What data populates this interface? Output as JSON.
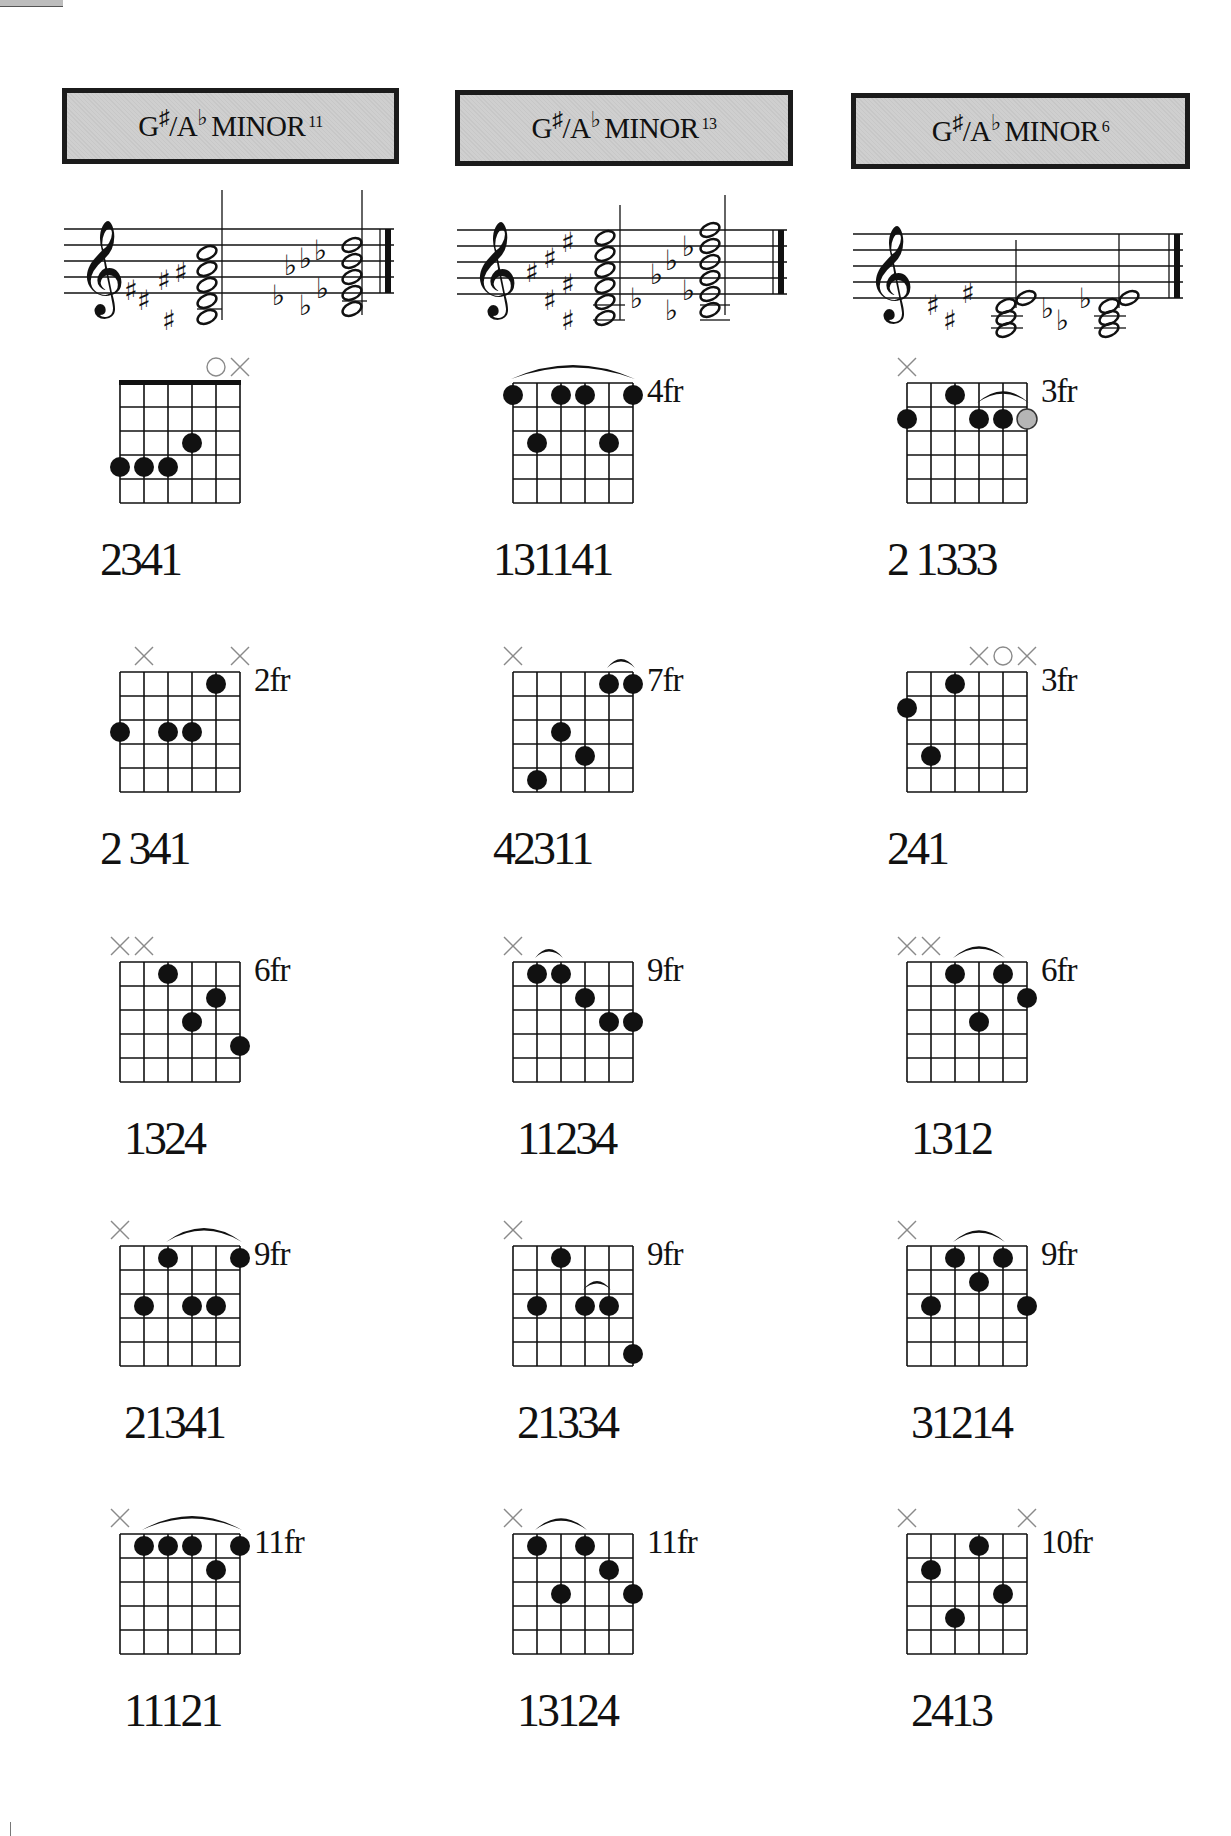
{
  "page": {
    "columns": [
      {
        "root": "G",
        "root_acc": "♯",
        "slash": "/A",
        "slash_acc": "♭",
        "quality": "MINOR",
        "ext": "11"
      },
      {
        "root": "G",
        "root_acc": "♯",
        "slash": "/A",
        "slash_acc": "♭",
        "quality": "MINOR",
        "ext": "13"
      },
      {
        "root": "G",
        "root_acc": "♯",
        "slash": "/A",
        "slash_acc": "♭",
        "quality": "MINOR",
        "ext": "6"
      }
    ]
  },
  "diagrams": [
    [
      {
        "nut": true,
        "fret": "",
        "markers": [
          {
            "s": 4,
            "t": "O"
          },
          {
            "s": 5,
            "t": "X"
          }
        ],
        "arcs": [],
        "dots": [
          [
            0,
            4
          ],
          [
            1,
            4
          ],
          [
            2,
            4
          ],
          [
            3,
            3
          ]
        ],
        "grey": [],
        "fingering": "2341"
      },
      {
        "nut": false,
        "fret": "4fr",
        "markers": [],
        "arcs": [
          [
            0,
            5
          ]
        ],
        "dots": [
          [
            0,
            1
          ],
          [
            2,
            1
          ],
          [
            3,
            1
          ],
          [
            5,
            1
          ],
          [
            1,
            3
          ],
          [
            4,
            3
          ]
        ],
        "grey": [],
        "fingering": "131141"
      },
      {
        "nut": false,
        "fret": "3fr",
        "markers": [
          {
            "s": 0,
            "t": "X"
          }
        ],
        "arcs": [
          [
            3,
            5,
            2
          ]
        ],
        "dots": [
          [
            0,
            2
          ],
          [
            2,
            1
          ],
          [
            3,
            2
          ],
          [
            4,
            2
          ]
        ],
        "grey": [
          [
            5,
            2
          ]
        ],
        "fingering": "2 1333"
      }
    ],
    [
      {
        "nut": false,
        "fret": "2fr",
        "markers": [
          {
            "s": 1,
            "t": "X"
          },
          {
            "s": 5,
            "t": "X"
          }
        ],
        "arcs": [],
        "dots": [
          [
            4,
            1
          ],
          [
            0,
            3
          ],
          [
            2,
            3
          ],
          [
            3,
            3
          ]
        ],
        "grey": [],
        "fingering": "2 341"
      },
      {
        "nut": false,
        "fret": "7fr",
        "markers": [
          {
            "s": 0,
            "t": "X"
          }
        ],
        "arcs": [
          [
            4,
            5
          ]
        ],
        "dots": [
          [
            4,
            1
          ],
          [
            5,
            1
          ],
          [
            2,
            3
          ],
          [
            3,
            4
          ],
          [
            1,
            5
          ]
        ],
        "grey": [],
        "fingering": "42311"
      },
      {
        "nut": false,
        "fret": "3fr",
        "markers": [
          {
            "s": 3,
            "t": "X"
          },
          {
            "s": 4,
            "t": "O"
          },
          {
            "s": 5,
            "t": "X"
          }
        ],
        "arcs": [],
        "dots": [
          [
            2,
            1
          ],
          [
            0,
            2
          ],
          [
            1,
            4
          ]
        ],
        "grey": [],
        "fingering": "241"
      }
    ],
    [
      {
        "nut": false,
        "fret": "6fr",
        "markers": [
          {
            "s": 0,
            "t": "X"
          },
          {
            "s": 1,
            "t": "X"
          }
        ],
        "arcs": [],
        "dots": [
          [
            2,
            1
          ],
          [
            4,
            2
          ],
          [
            3,
            3
          ],
          [
            5,
            4
          ]
        ],
        "grey": [],
        "fingering": "1324"
      },
      {
        "nut": false,
        "fret": "9fr",
        "markers": [
          {
            "s": 0,
            "t": "X"
          }
        ],
        "arcs": [
          [
            1,
            2
          ]
        ],
        "dots": [
          [
            1,
            1
          ],
          [
            2,
            1
          ],
          [
            3,
            2
          ],
          [
            4,
            3
          ],
          [
            5,
            3
          ]
        ],
        "grey": [],
        "fingering": "11234"
      },
      {
        "nut": false,
        "fret": "6fr",
        "markers": [
          {
            "s": 0,
            "t": "X"
          },
          {
            "s": 1,
            "t": "X"
          }
        ],
        "arcs": [
          [
            2,
            4
          ]
        ],
        "dots": [
          [
            2,
            1
          ],
          [
            4,
            1
          ],
          [
            5,
            2
          ],
          [
            3,
            3
          ]
        ],
        "grey": [],
        "fingering": "1312"
      }
    ],
    [
      {
        "nut": false,
        "fret": "9fr",
        "markers": [
          {
            "s": 0,
            "t": "X"
          }
        ],
        "arcs": [
          [
            2,
            5
          ]
        ],
        "dots": [
          [
            2,
            1
          ],
          [
            5,
            1
          ],
          [
            1,
            3
          ],
          [
            3,
            3
          ],
          [
            4,
            3
          ]
        ],
        "grey": [],
        "fingering": "21341"
      },
      {
        "nut": false,
        "fret": "9fr",
        "markers": [
          {
            "s": 0,
            "t": "X"
          }
        ],
        "arcs": [
          [
            3,
            4,
            3
          ]
        ],
        "dots": [
          [
            2,
            1
          ],
          [
            1,
            3
          ],
          [
            3,
            3
          ],
          [
            4,
            3
          ],
          [
            5,
            5
          ]
        ],
        "grey": [],
        "fingering": "21334"
      },
      {
        "nut": false,
        "fret": "9fr",
        "markers": [
          {
            "s": 0,
            "t": "X"
          }
        ],
        "arcs": [
          [
            2,
            4
          ]
        ],
        "dots": [
          [
            2,
            1
          ],
          [
            4,
            1
          ],
          [
            3,
            2
          ],
          [
            1,
            3
          ],
          [
            5,
            3
          ]
        ],
        "grey": [],
        "fingering": "31214"
      }
    ],
    [
      {
        "nut": false,
        "fret": "11fr",
        "markers": [
          {
            "s": 0,
            "t": "X"
          }
        ],
        "arcs": [
          [
            1,
            5
          ]
        ],
        "dots": [
          [
            1,
            1
          ],
          [
            2,
            1
          ],
          [
            3,
            1
          ],
          [
            5,
            1
          ],
          [
            4,
            2
          ]
        ],
        "grey": [],
        "fingering": "11121"
      },
      {
        "nut": false,
        "fret": "11fr",
        "markers": [
          {
            "s": 0,
            "t": "X"
          }
        ],
        "arcs": [
          [
            1,
            3
          ]
        ],
        "dots": [
          [
            1,
            1
          ],
          [
            3,
            1
          ],
          [
            4,
            2
          ],
          [
            2,
            3
          ],
          [
            5,
            3
          ]
        ],
        "grey": [],
        "fingering": "13124"
      },
      {
        "nut": false,
        "fret": "10fr",
        "markers": [
          {
            "s": 0,
            "t": "X"
          },
          {
            "s": 5,
            "t": "X"
          }
        ],
        "arcs": [],
        "dots": [
          [
            3,
            1
          ],
          [
            1,
            2
          ],
          [
            4,
            3
          ],
          [
            2,
            4
          ]
        ],
        "grey": [],
        "fingering": "2413"
      }
    ]
  ],
  "colors": {
    "header_bg": "#cfcfcf",
    "ink": "#111111",
    "marker": "#8a8a8a",
    "grey_dot": "#b5b5b5"
  }
}
